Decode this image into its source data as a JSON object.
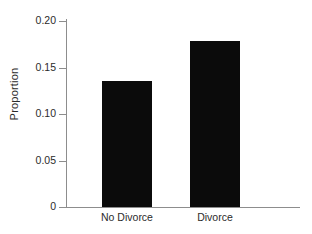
{
  "chart_data": {
    "type": "bar",
    "title": "",
    "subtitle": "",
    "xlabel": "",
    "ylabel": "Proportion",
    "categories": [
      "No Divorce",
      "Divorce"
    ],
    "values": [
      0.136,
      0.178
    ],
    "ylim": [
      0,
      0.2
    ],
    "yticks": [
      0,
      0.05,
      0.1,
      0.15,
      0.2
    ],
    "ytick_labels": [
      "0",
      "0.05",
      "0.10",
      "0.15",
      "0.20"
    ],
    "xtick_labels": [
      "No Divorce",
      "Divorce"
    ],
    "grid": false,
    "legend": null,
    "legend_position": "none",
    "annotations": [],
    "bar_color": "#0b0b0b",
    "axis_color": "#8d8d8d",
    "background_color": "#ffffff"
  },
  "axes": {
    "y_title": "Proportion"
  }
}
